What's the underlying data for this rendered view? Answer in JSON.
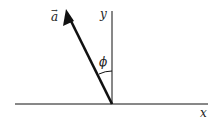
{
  "diagram": {
    "vector_label": "a",
    "vector_arrow_glyph": "→",
    "y_axis_label": "y",
    "x_axis_label": "x",
    "angle_label": "ϕ",
    "colors": {
      "line": "#111111",
      "background": "#ffffff"
    }
  }
}
